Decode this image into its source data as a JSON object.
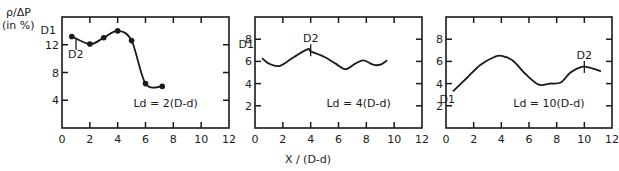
{
  "ylabel_line1": "ρ/ΔP",
  "ylabel_line2": "(in  %)",
  "xlabel": "X  /  (D-d)",
  "chart_data": [
    {
      "type": "line",
      "title": "Ld = 2(D-d)",
      "xlabel": "X / (D-d)",
      "ylabel": "ρ/ΔP (in %)",
      "xlim": [
        0,
        12
      ],
      "ylim": [
        0,
        16
      ],
      "xticks": [
        0,
        2,
        4,
        6,
        8,
        10,
        12
      ],
      "yticks": [
        4,
        8,
        12
      ],
      "markers": true,
      "x": [
        0.7,
        2.0,
        3.0,
        4.0,
        5.0,
        6.0,
        7.2
      ],
      "y": [
        13.2,
        12.1,
        13.0,
        14.0,
        12.6,
        6.4,
        6.0
      ],
      "annotations": [
        {
          "text": "D1",
          "x": 0.7,
          "y": 13.2
        },
        {
          "text": "D2",
          "x": 2.0,
          "y": 12.1
        }
      ]
    },
    {
      "type": "line",
      "title": "Ld = 4(D-d)",
      "xlabel": "X / (D-d)",
      "ylabel": "ρ/ΔP (in %)",
      "xlim": [
        0,
        12
      ],
      "ylim": [
        0,
        10
      ],
      "xticks": [
        0,
        2,
        4,
        6,
        8,
        10,
        12
      ],
      "yticks": [
        2,
        4,
        6,
        8
      ],
      "markers": false,
      "x": [
        0.5,
        1.0,
        1.8,
        2.8,
        3.8,
        4.0,
        5.0,
        5.8,
        6.5,
        7.2,
        7.8,
        8.5,
        9.0,
        9.5
      ],
      "y": [
        6.3,
        5.8,
        5.6,
        6.4,
        7.1,
        6.9,
        6.4,
        5.8,
        5.3,
        5.8,
        6.1,
        5.7,
        5.7,
        6.1
      ],
      "annotations": [
        {
          "text": "D1",
          "x": 0.5,
          "y": 6.3
        },
        {
          "text": "D2",
          "x": 4.0,
          "y": 7.0
        }
      ]
    },
    {
      "type": "line",
      "title": "Ld = 10(D-d)",
      "xlabel": "X / (D-d)",
      "ylabel": "ρ/ΔP (in %)",
      "xlim": [
        0,
        12
      ],
      "ylim": [
        0,
        10
      ],
      "xticks": [
        0,
        2,
        4,
        6,
        8,
        10,
        12
      ],
      "yticks": [
        2,
        4,
        6,
        8
      ],
      "markers": false,
      "x": [
        0.5,
        1.5,
        2.5,
        3.5,
        4.0,
        4.8,
        5.8,
        6.7,
        7.5,
        8.3,
        9.0,
        9.8,
        10.5,
        11.2
      ],
      "y": [
        3.3,
        4.5,
        5.7,
        6.4,
        6.5,
        6.1,
        4.8,
        3.9,
        4.0,
        4.1,
        5.0,
        5.5,
        5.4,
        5.1
      ],
      "annotations": [
        {
          "text": "D1",
          "x": 0.5,
          "y": 3.3
        },
        {
          "text": "D2",
          "x": 10.0,
          "y": 5.5
        }
      ]
    }
  ]
}
